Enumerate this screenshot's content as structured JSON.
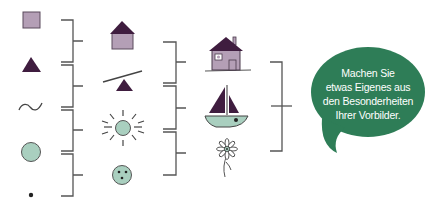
{
  "colors": {
    "mauve": "#b49fb6",
    "plum": "#3f1d3f",
    "mint": "#a9cfbf",
    "line": "#444444",
    "bubble": "#2e7d57",
    "bubble_text": "#ffffff"
  },
  "columns": [
    {
      "name": "basic-shapes",
      "items": [
        "square",
        "triangle",
        "wave-line",
        "circle",
        "dot"
      ]
    },
    {
      "name": "combined-shapes",
      "items": [
        "simple-house",
        "seesaw",
        "sun",
        "face-ball"
      ]
    },
    {
      "name": "detailed-images",
      "items": [
        "house",
        "sailboat",
        "flower"
      ]
    }
  ],
  "speech_bubble": {
    "lines": [
      "Machen Sie",
      "etwas Eigenes aus",
      "den Besonderheiten",
      "Ihrer Vorbilder."
    ]
  }
}
